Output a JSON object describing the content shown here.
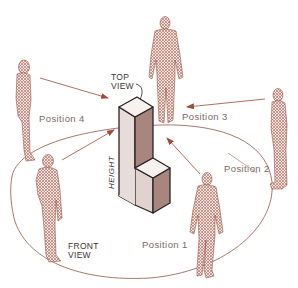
{
  "diagram": {
    "title": "",
    "labels": {
      "top_view": [
        "TOP",
        "VIEW"
      ],
      "front_view": [
        "FRONT",
        "VIEW"
      ],
      "height": "HEIGHT",
      "positions": [
        "Position 1",
        "Position 2",
        "Position 3",
        "Position 4"
      ]
    },
    "colors": {
      "figure": "#8a3a2a",
      "arrow": "#a04a3a",
      "ellipse": "#9a6a60",
      "block_light": "#e8dcda",
      "block_mid": "#c9b3ae",
      "block_dark": "#a8857d",
      "outline": "#2a2222",
      "label": "#7a6a66"
    },
    "elements": {
      "object": "L-shaped block (isometric)",
      "viewing_circle": "ellipse around object",
      "observers": 6
    }
  }
}
